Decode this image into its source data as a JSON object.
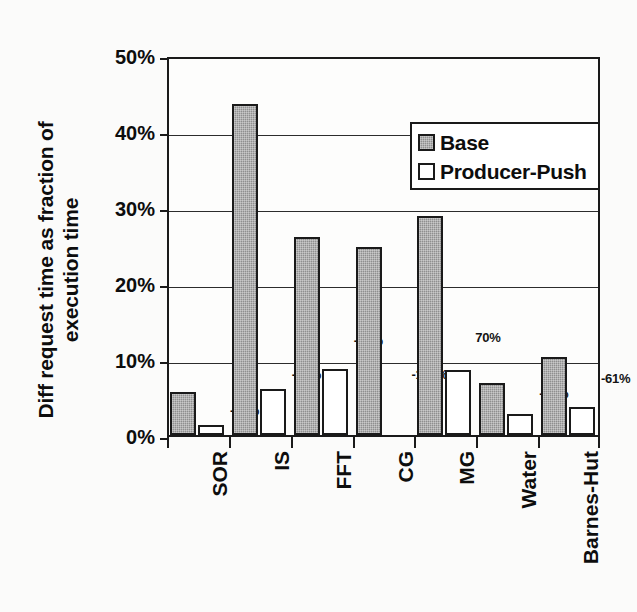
{
  "chart_data": {
    "type": "bar",
    "title": "",
    "xlabel": "",
    "ylabel_lines": [
      "Diff request time as fraction of",
      "execution time"
    ],
    "ylabel": "Diff request time as fraction of execution time",
    "categories": [
      "SOR",
      "IS",
      "FFT",
      "CG",
      "MG",
      "Water",
      "Barnes-Hut"
    ],
    "series": [
      {
        "name": "Base",
        "values": [
          5.7,
          43.5,
          26.0,
          24.8,
          28.8,
          6.8,
          10.2
        ],
        "color": "#8f8f8f"
      },
      {
        "name": "Producer-Push",
        "values": [
          1.3,
          6.0,
          8.7,
          0.0,
          8.5,
          2.7,
          3.7
        ],
        "color": "#ffffff"
      }
    ],
    "annotations": [
      "-77%",
      "-86%",
      "-65%",
      "-100%",
      "70%",
      "-57%",
      "-61%"
    ],
    "ylim": [
      0,
      50
    ],
    "ytick_values": [
      0,
      10,
      20,
      30,
      40,
      50
    ],
    "ytick_labels": [
      "0%",
      "10%",
      "20%",
      "30%",
      "40%",
      "50%"
    ],
    "grid": true,
    "legend_position": "upper-right",
    "legend_entries": [
      "Base",
      "Producer-Push"
    ]
  },
  "legend": {
    "entries": [
      {
        "label": "Base",
        "swatch": "filled-gray-swatch"
      },
      {
        "label": "Producer-Push",
        "swatch": "empty-white-swatch"
      }
    ]
  }
}
